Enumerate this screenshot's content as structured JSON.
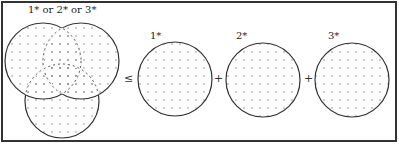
{
  "diagram": {
    "union_label": "1* or 2* or 3*",
    "relation_symbol": "≤",
    "plus_1": "+",
    "plus_2": "+",
    "sets": [
      {
        "label": "1*"
      },
      {
        "label": "2*"
      },
      {
        "label": "3*"
      }
    ],
    "colors": {
      "stroke": "#333333",
      "dot": "#777777",
      "border": "#333333",
      "background": "#ffffff"
    }
  }
}
